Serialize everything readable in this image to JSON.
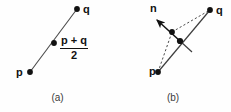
{
  "figure": {
    "width": 231,
    "height": 112,
    "background_color": "#fefefe",
    "ink_color": "#111111",
    "line_color": "#4a4a4a"
  },
  "panels": [
    {
      "id": "a",
      "caption": "(a)",
      "labels": {
        "p": "p",
        "q": "q",
        "midpoint_numerator": "p + q",
        "midpoint_denominator": "2"
      },
      "points": [
        {
          "name": "p",
          "x": 30,
          "y": 72
        },
        {
          "name": "midpoint",
          "x": 54,
          "y": 43
        },
        {
          "name": "q",
          "x": 77,
          "y": 9
        }
      ],
      "segments": [
        {
          "name": "p-to-q",
          "style": "solid",
          "x1": 30,
          "y1": 72,
          "x2": 77,
          "y2": 9
        }
      ]
    },
    {
      "id": "b",
      "caption": "(b)",
      "labels": {
        "p": "p",
        "q": "q",
        "n": "n"
      },
      "points": [
        {
          "name": "p",
          "x": 43,
          "y": 72
        },
        {
          "name": "upper-node",
          "x": 57,
          "y": 32
        },
        {
          "name": "lower-node",
          "x": 65,
          "y": 41
        },
        {
          "name": "q",
          "x": 95,
          "y": 10
        }
      ],
      "segments": [
        {
          "name": "p-to-upper-node",
          "style": "dashed",
          "x1": 43,
          "y1": 72,
          "x2": 57,
          "y2": 32
        },
        {
          "name": "upper-node-to-q",
          "style": "dashed",
          "x1": 57,
          "y1": 32,
          "x2": 95,
          "y2": 10
        },
        {
          "name": "p-to-q",
          "style": "solid",
          "x1": 43,
          "y1": 72,
          "x2": 95,
          "y2": 10
        },
        {
          "name": "tangent-tick",
          "style": "solid",
          "x1": 65,
          "y1": 41,
          "x2": 77,
          "y2": 52
        },
        {
          "name": "normal-arrow",
          "style": "solid-arrow",
          "x1": 65,
          "y1": 41,
          "x2": 41,
          "y2": 19
        }
      ]
    }
  ]
}
